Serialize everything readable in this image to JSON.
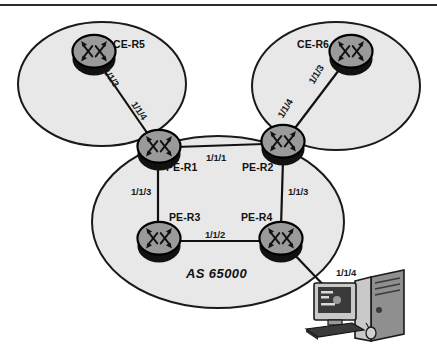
{
  "diagram": {
    "colors": {
      "cloud_fill": "#e8e8e8",
      "cloud_stroke": "#1a1a1a",
      "router_body": "#9a9a9a",
      "router_shadow": "#111111",
      "router_stroke": "#000000",
      "link_stroke": "#111111",
      "text": "#111111",
      "border_rule": "#2b2b2b",
      "pc_dark": "#3a3a3a",
      "pc_mid": "#8f8f8f",
      "pc_light": "#cfcfcf"
    },
    "clouds": [
      {
        "name": "left-customer-cloud",
        "cx": 102,
        "cy": 84,
        "rx": 84,
        "ry": 62
      },
      {
        "name": "right-customer-cloud",
        "cx": 336,
        "cy": 86,
        "rx": 84,
        "ry": 64
      },
      {
        "name": "as-core-cloud",
        "cx": 218,
        "cy": 222,
        "rx": 126,
        "ry": 86
      }
    ],
    "nodes": [
      {
        "id": "ce-r5",
        "label": "CE-R5",
        "x": 93,
        "y": 53,
        "label_dx": 22,
        "label_dy": -10,
        "icon": "router-icon"
      },
      {
        "id": "ce-r6",
        "label": "CE-R6",
        "x": 350,
        "y": 53,
        "label_dx": -52,
        "label_dy": -10,
        "icon": "router-icon"
      },
      {
        "id": "pe-r1",
        "label": "PE-R1",
        "x": 158,
        "y": 148,
        "label_dx": 10,
        "label_dy": 16,
        "icon": "router-icon"
      },
      {
        "id": "pe-r2",
        "label": "PE-R2",
        "x": 282,
        "y": 143,
        "label_dx": -42,
        "label_dy": 20,
        "icon": "router-icon"
      },
      {
        "id": "pe-r3",
        "label": "PE-R3",
        "x": 158,
        "y": 240,
        "label_dx": 12,
        "label_dy": -26,
        "icon": "router-icon"
      },
      {
        "id": "pe-r4",
        "label": "PE-R4",
        "x": 280,
        "y": 240,
        "label_dx": -40,
        "label_dy": -26,
        "icon": "router-icon"
      }
    ],
    "links": [
      {
        "id": "ce-r5--pe-r1",
        "from": "ce-r5",
        "to": "pe-r1"
      },
      {
        "id": "ce-r6--pe-r2",
        "from": "ce-r6",
        "to": "pe-r2"
      },
      {
        "id": "pe-r1--pe-r2",
        "from": "pe-r1",
        "to": "pe-r2"
      },
      {
        "id": "pe-r1--pe-r3",
        "from": "pe-r1",
        "to": "pe-r3"
      },
      {
        "id": "pe-r2--pe-r4",
        "from": "pe-r2",
        "to": "pe-r4"
      },
      {
        "id": "pe-r3--pe-r4",
        "from": "pe-r3",
        "to": "pe-r4"
      },
      {
        "id": "pe-r4--pc",
        "from": "pe-r4",
        "to": "pc-workstation"
      }
    ],
    "interface_labels": [
      {
        "id": "if-ce-r5-113",
        "text": "1/1/3",
        "x": 112,
        "y": 70,
        "rotate": 55,
        "link": "ce-r5--pe-r1"
      },
      {
        "id": "if-pe-r1-114",
        "text": "1/1/4",
        "x": 140,
        "y": 103,
        "rotate": 55,
        "link": "ce-r5--pe-r1"
      },
      {
        "id": "if-ce-r6-113",
        "text": "1/1/3",
        "x": 312,
        "y": 71,
        "rotate": -58,
        "link": "ce-r6--pe-r2"
      },
      {
        "id": "if-pe-r2-114",
        "text": "1/1/4",
        "x": 281,
        "y": 104,
        "rotate": -58,
        "link": "ce-r6--pe-r2"
      },
      {
        "id": "if-pe-r1-111",
        "text": "1/1/1",
        "x": 206,
        "y": 155,
        "rotate": 0,
        "link": "pe-r1--pe-r2"
      },
      {
        "id": "if-pe-r1-113",
        "text": "1/1/3",
        "x": 133,
        "y": 190,
        "rotate": 0,
        "link": "pe-r1--pe-r3"
      },
      {
        "id": "if-pe-r2-113",
        "text": "1/1/3",
        "x": 288,
        "y": 190,
        "rotate": 0,
        "link": "pe-r2--pe-r4"
      },
      {
        "id": "if-pe-r3-112",
        "text": "1/1/2",
        "x": 207,
        "y": 232,
        "rotate": 0,
        "link": "pe-r3--pe-r4"
      },
      {
        "id": "if-pe-r4-114",
        "text": "1/1/4",
        "x": 338,
        "y": 272,
        "rotate": 0,
        "link": "pe-r4--pc"
      }
    ],
    "as_label": {
      "text": "AS 65000",
      "x": 186,
      "y": 268
    },
    "workstation": {
      "id": "pc-workstation",
      "label": "workstation",
      "x": 310,
      "y": 288
    }
  }
}
